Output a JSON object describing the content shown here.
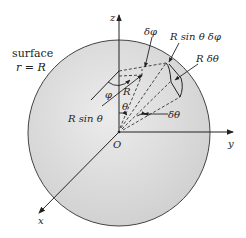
{
  "figure": {
    "type": "spherical-coordinates-surface-element",
    "sphere_fill": "#dcdcdc",
    "line_color": "#222222"
  },
  "labels": {
    "surface_line1": "surface",
    "surface_line2": "r = R",
    "z_axis": "z",
    "y_axis": "y",
    "x_axis": "x",
    "origin": "O",
    "delta_phi": "δφ",
    "arc_length_phi": "R sin θ δφ",
    "arc_length_theta": "R δθ",
    "phi": "φ",
    "radius": "R",
    "r_sin_theta": "R sin θ",
    "theta": "θ",
    "delta_theta": "δθ"
  }
}
